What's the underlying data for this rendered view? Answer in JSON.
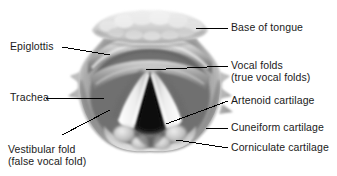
{
  "figure": {
    "background_color": "#ffffff",
    "text_color": "#1a1a1a",
    "leader_line_color": "#000000"
  },
  "labels": {
    "base_of_tongue": "Base of tongue",
    "vocal_folds_line1": "Vocal folds",
    "vocal_folds_line2": "(true vocal folds)",
    "artenoid_cartilage": "Artenoid cartilage",
    "cuneiform_cartilage": "Cuneiform cartilage",
    "corniculate_cartilage": "Corniculate cartilage",
    "epiglottis": "Epiglottis",
    "trachea": "Trachea",
    "vestibular_fold_line1": "Vestibular fold",
    "vestibular_fold_line2": "(false vocal fold)"
  },
  "structures": {
    "lingual_tonsil": "lingual-tonsil-band",
    "epiglottis": "epiglottis-fold",
    "vestibular_folds": "false-vocal-folds",
    "vocal_folds": "true-vocal-folds",
    "glottis": "glottic-opening",
    "trachea": "tracheal-lumen",
    "arytenoid": "arytenoid-cartilage-mass",
    "cuneiform": "cuneiform-tubercle",
    "corniculate": "corniculate-tubercle"
  },
  "palette": {
    "tissue_light": "#dcdcdc",
    "tissue_mid": "#9a9a9a",
    "tissue_dark": "#5a5a5a",
    "fold_highlight": "#f2f2f2",
    "glottis_dark": "#1c1c1c",
    "trachea_dark": "#2a2a2a"
  }
}
